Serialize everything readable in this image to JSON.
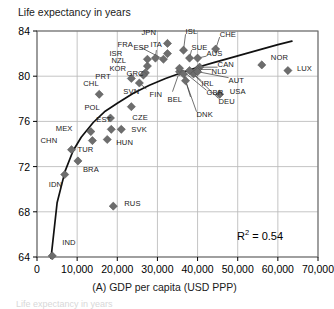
{
  "chart_data": {
    "type": "scatter",
    "title": "",
    "ylabel": "Life expectancy in years",
    "xlabel": "(A) GDP per capita (USD PPP)",
    "xlim": [
      0,
      70000
    ],
    "ylim": [
      64,
      84
    ],
    "xticks": [
      "0",
      "10,000",
      "20,000",
      "30,000",
      "40,000",
      "50,000",
      "60,000",
      "70,000"
    ],
    "xtick_values": [
      0,
      10000,
      20000,
      30000,
      40000,
      50000,
      60000,
      70000
    ],
    "yticks": [
      "64",
      "68",
      "72",
      "76",
      "80",
      "84"
    ],
    "ytick_values": [
      64,
      68,
      72,
      76,
      80,
      84
    ],
    "grid": true,
    "legend": "none",
    "annotation": "R2 = 0.54",
    "r_squared_label": "R",
    "r_squared_exp": "2",
    "r_squared_value": "= 0.54",
    "marker": "diamond",
    "marker_color": "#6d6d6d",
    "trendline": "logarithmic fit",
    "points": [
      {
        "code": "IND",
        "x": 3800,
        "y": 64.1,
        "lx": 10,
        "ly": -13
      },
      {
        "code": "IDN",
        "x": 6900,
        "y": 71.3,
        "lx": -2,
        "ly": 10
      },
      {
        "code": "CHN",
        "x": 8600,
        "y": 73.5,
        "lx": -17,
        "ly": -9
      },
      {
        "code": "BRA",
        "x": 10200,
        "y": 72.5,
        "lx": 5,
        "ly": 9
      },
      {
        "code": "RUS",
        "x": 19000,
        "y": 68.5,
        "lx": 11,
        "ly": -2
      },
      {
        "code": "TUR",
        "x": 13800,
        "y": 74.3,
        "lx": -1,
        "ly": 9
      },
      {
        "code": "MEX",
        "x": 13400,
        "y": 75.1,
        "lx": -21,
        "ly": -3
      },
      {
        "code": "HUN",
        "x": 17500,
        "y": 74.4,
        "lx": 9,
        "ly": 4
      },
      {
        "code": "EST",
        "x": 18500,
        "y": 75.3,
        "lx": -1,
        "ly": -9
      },
      {
        "code": "SVK",
        "x": 21000,
        "y": 75.3,
        "lx": 10,
        "ly": 1
      },
      {
        "code": "POL",
        "x": 18300,
        "y": 76.3,
        "lx": -12,
        "ly": -10
      },
      {
        "code": "CZE",
        "x": 23500,
        "y": 77.3,
        "lx": 1,
        "ly": 11
      },
      {
        "code": "CHL",
        "x": 15500,
        "y": 78.4,
        "lx": -2,
        "ly": -10
      },
      {
        "code": "SVN",
        "x": 25500,
        "y": 79.4,
        "lx": -2,
        "ly": 9
      },
      {
        "code": "PRT",
        "x": 23500,
        "y": 79.8,
        "lx": -22,
        "ly": -1
      },
      {
        "code": "KOR",
        "x": 27000,
        "y": 80.3,
        "lx": -22,
        "ly": -4
      },
      {
        "code": "NZL",
        "x": 27500,
        "y": 80.9,
        "lx": -22,
        "ly": -5
      },
      {
        "code": "GRC",
        "x": 26500,
        "y": 80.1,
        "lx": -3,
        "ly": -1
      },
      {
        "code": "ESP",
        "x": 29500,
        "y": 81.6,
        "lx": -8,
        "ly": -10
      },
      {
        "code": "ISR",
        "x": 27500,
        "y": 81.5,
        "lx": -24,
        "ly": -5
      },
      {
        "code": "FRA",
        "x": 31500,
        "y": 81.5,
        "lx": -32,
        "ly": -14
      },
      {
        "code": "JPN",
        "x": 32500,
        "y": 82.9,
        "lx": -12,
        "ly": -10
      },
      {
        "code": "ITA",
        "x": 32500,
        "y": 82.0,
        "lx": -3,
        "ly": -9
      },
      {
        "code": "FIN",
        "x": 35500,
        "y": 80.4,
        "lx": -16,
        "ly": 23
      },
      {
        "code": "BEL",
        "x": 36500,
        "y": 80.2,
        "lx": -2,
        "ly": 26
      },
      {
        "code": "SUE",
        "x": 38000,
        "y": 81.6,
        "lx": 2,
        "ly": -10
      },
      {
        "code": "ISL",
        "x": 36500,
        "y": 82.3,
        "lx": 2,
        "ly": -18
      },
      {
        "code": "AUS",
        "x": 40000,
        "y": 81.6,
        "lx": 9,
        "ly": -4
      },
      {
        "code": "CHE",
        "x": 44500,
        "y": 82.4,
        "lx": 4,
        "ly": -14
      },
      {
        "code": "CAN",
        "x": 40500,
        "y": 80.8,
        "lx": 18,
        "ly": -2
      },
      {
        "code": "NLD",
        "x": 40000,
        "y": 80.6,
        "lx": 14,
        "ly": 3
      },
      {
        "code": "IRL",
        "x": 39000,
        "y": 80.2,
        "lx": 8,
        "ly": 10
      },
      {
        "code": "AUT",
        "x": 40000,
        "y": 80.4,
        "lx": 31,
        "ly": 9
      },
      {
        "code": "USA",
        "x": 45500,
        "y": 78.4,
        "lx": 10,
        "ly": -2
      },
      {
        "code": "GBR",
        "x": 35500,
        "y": 80.7,
        "lx": 27,
        "ly": 25
      },
      {
        "code": "DEU",
        "x": 38000,
        "y": 80.5,
        "lx": 29,
        "ly": 31
      },
      {
        "code": "DNK",
        "x": 37000,
        "y": 79.6,
        "lx": 11,
        "ly": 34
      },
      {
        "code": "NOR",
        "x": 56000,
        "y": 81.0,
        "lx": 9,
        "ly": -7
      },
      {
        "code": "LUX",
        "x": 62500,
        "y": 80.5,
        "lx": 9,
        "ly": -2
      }
    ],
    "trendline_points": [
      {
        "x": 3500,
        "y": 63.9
      },
      {
        "x": 5000,
        "y": 68.8
      },
      {
        "x": 7000,
        "y": 71.6
      },
      {
        "x": 9000,
        "y": 73.4
      },
      {
        "x": 11000,
        "y": 74.6
      },
      {
        "x": 14000,
        "y": 75.9
      },
      {
        "x": 17000,
        "y": 76.9
      },
      {
        "x": 20000,
        "y": 77.6
      },
      {
        "x": 24000,
        "y": 78.5
      },
      {
        "x": 28000,
        "y": 79.2
      },
      {
        "x": 32000,
        "y": 79.8
      },
      {
        "x": 36000,
        "y": 80.3
      },
      {
        "x": 40000,
        "y": 80.8
      },
      {
        "x": 44000,
        "y": 81.2
      },
      {
        "x": 48000,
        "y": 81.6
      },
      {
        "x": 52000,
        "y": 82.0
      },
      {
        "x": 56000,
        "y": 82.4
      },
      {
        "x": 60000,
        "y": 82.8
      },
      {
        "x": 63500,
        "y": 83.1
      }
    ],
    "leader_lines": [
      {
        "from": "FRA",
        "to_x": 31500,
        "to_y": 81.5
      },
      {
        "from": "GBR",
        "to_x": 35500,
        "to_y": 80.7
      },
      {
        "from": "DEU",
        "to_x": 38000,
        "to_y": 80.5
      },
      {
        "from": "DNK",
        "to_x": 37000,
        "to_y": 79.6
      },
      {
        "from": "AUT",
        "to_x": 40000,
        "to_y": 80.4
      },
      {
        "from": "CAN",
        "to_x": 40500,
        "to_y": 80.8
      },
      {
        "from": "NLD",
        "to_x": 40000,
        "to_y": 80.6
      },
      {
        "from": "IRL",
        "to_x": 39000,
        "to_y": 80.2
      },
      {
        "from": "ISL",
        "to_x": 36500,
        "to_y": 82.3
      },
      {
        "from": "SUE",
        "to_x": 38000,
        "to_y": 81.6
      },
      {
        "from": "AUS",
        "to_x": 40000,
        "to_y": 81.6
      },
      {
        "from": "CHE",
        "to_x": 44500,
        "to_y": 82.4
      },
      {
        "from": "FIN",
        "to_x": 35500,
        "to_y": 80.4
      },
      {
        "from": "BEL",
        "to_x": 36500,
        "to_y": 80.2
      },
      {
        "from": "SVN",
        "to_x": 25500,
        "to_y": 79.4
      },
      {
        "from": "ESP",
        "to_x": 29500,
        "to_y": 81.6
      }
    ]
  },
  "bottom_partial_text": "Life expectancy in years"
}
